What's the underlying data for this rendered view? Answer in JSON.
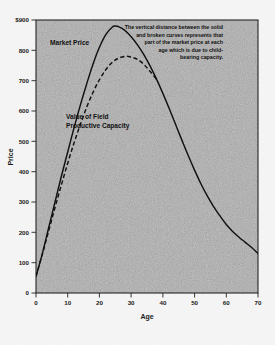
{
  "chart_data": {
    "type": "line",
    "title": "",
    "xlabel": "Age",
    "ylabel": "Price",
    "xlim": [
      0,
      70
    ],
    "ylim": [
      0,
      900
    ],
    "grid": false,
    "legend_position": "inline-annotations",
    "x_ticks": [
      "0",
      "10",
      "20",
      "30",
      "40",
      "50",
      "60",
      "70"
    ],
    "x_tick_values": [
      0,
      10,
      20,
      30,
      40,
      50,
      60,
      70
    ],
    "y_ticks": [
      "0",
      "100",
      "200",
      "300",
      "400",
      "500",
      "600",
      "700",
      "800",
      "$900"
    ],
    "y_tick_values": [
      0,
      100,
      200,
      300,
      400,
      500,
      600,
      700,
      800,
      900
    ],
    "series": [
      {
        "name": "Market Price",
        "style": "solid",
        "x": [
          0,
          2,
          4,
          6,
          8,
          10,
          12,
          14,
          16,
          18,
          20,
          22,
          24,
          25,
          26,
          28,
          30,
          32,
          34,
          36,
          38,
          40,
          42,
          44,
          46,
          48,
          50,
          52,
          54,
          56,
          58,
          60,
          62,
          64,
          66,
          68,
          70
        ],
        "values": [
          55,
          130,
          215,
          300,
          385,
          465,
          545,
          620,
          690,
          755,
          810,
          852,
          876,
          880,
          878,
          866,
          845,
          818,
          786,
          748,
          705,
          658,
          608,
          556,
          504,
          453,
          405,
          360,
          320,
          285,
          254,
          226,
          203,
          184,
          167,
          150,
          130
        ]
      },
      {
        "name": "Value of Field Productive Capacity",
        "style": "dashed",
        "x": [
          0,
          2,
          4,
          6,
          8,
          10,
          12,
          14,
          16,
          18,
          20,
          22,
          24,
          26,
          28,
          29,
          30,
          32,
          34,
          36,
          38
        ],
        "values": [
          55,
          128,
          205,
          282,
          356,
          428,
          495,
          556,
          613,
          662,
          703,
          736,
          760,
          774,
          780,
          780,
          778,
          770,
          754,
          730,
          705
        ]
      }
    ],
    "annotations": [
      {
        "name": "market-price-label",
        "text": "Market Price",
        "x": 6,
        "y": 820
      },
      {
        "name": "field-capacity-label",
        "text": "Value of Field\nProductive Capacity",
        "x": 9,
        "y": 580
      },
      {
        "name": "explanatory-note",
        "text": "The vertical distance between the solid and broken curves represents that part of the market price at each age which is due to child-bearing capacity.",
        "align": "right"
      }
    ]
  },
  "axes": {
    "y_title": "Price",
    "x_title": "Age"
  },
  "labels": {
    "market_price": "Market Price",
    "field_capacity_line1": "Value of Field",
    "field_capacity_line2": "Productive Capacity"
  },
  "note": {
    "line1": "The vertical distance between the solid",
    "line2": "and broken curves represents that",
    "line3": "part of the market price at each",
    "line4": "age which is due to child-",
    "line5": "bearing capacity."
  },
  "ticks": {
    "y": [
      "$900",
      "800",
      "700",
      "600",
      "500",
      "400",
      "300",
      "200",
      "100",
      "0"
    ],
    "x": [
      "0",
      "10",
      "20",
      "30",
      "40",
      "50",
      "60",
      "70"
    ]
  },
  "colors": {
    "curve": "#111111",
    "frame": "#222222",
    "text": "#101010",
    "plot_bg": "#b3b3b3",
    "page_bg": "#ffffff"
  }
}
